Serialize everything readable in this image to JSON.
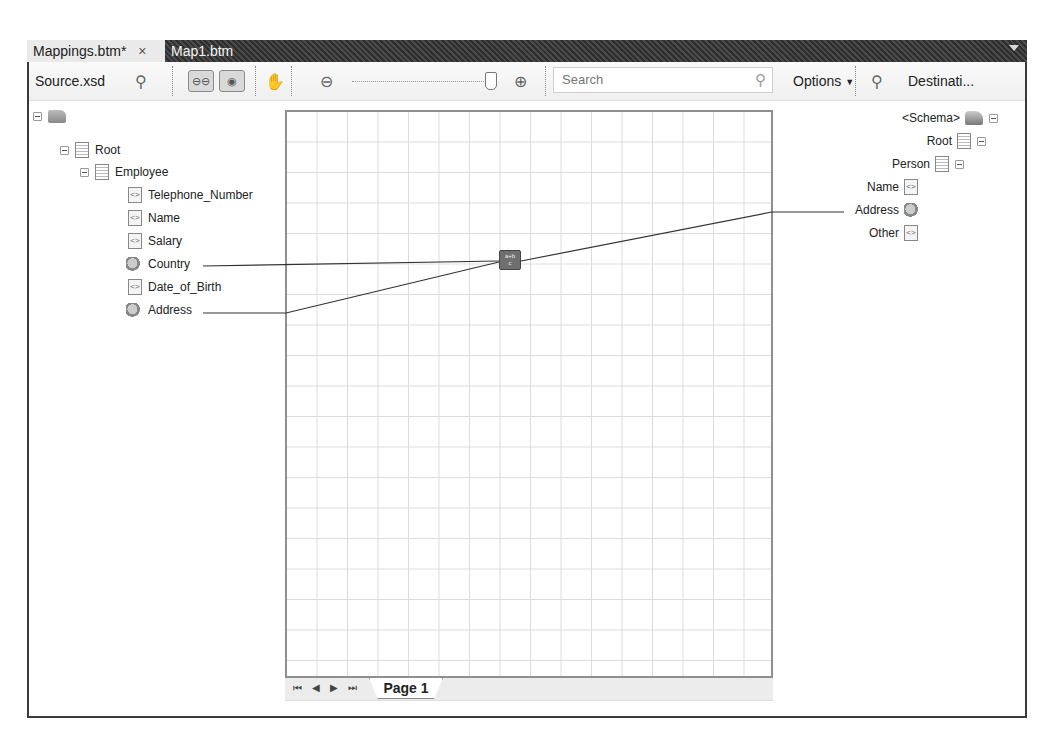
{
  "tabs": [
    {
      "label": "Mappings.btm*",
      "active": true,
      "close": "×"
    },
    {
      "label": "Map1.btm",
      "active": false
    }
  ],
  "toolbar": {
    "source_label": "Source.xsd",
    "search_placeholder": "Search",
    "options_label": "Options",
    "destination_label": "Destinati...",
    "zoom_level_percent": 100,
    "icons": [
      "source-schema-icon",
      "relevance-links-icon",
      "relevance-functoids-icon",
      "pan-hand-icon",
      "zoom-out-icon",
      "zoom-slider",
      "zoom-in-icon",
      "search-icon",
      "destination-schema-icon"
    ]
  },
  "source_tree": {
    "root_icon": "folder-icon",
    "nodes": [
      {
        "label": "Root",
        "type": "record",
        "level": 1
      },
      {
        "label": "Employee",
        "type": "record",
        "level": 2
      },
      {
        "label": "Telephone_Number",
        "type": "field",
        "level": 3
      },
      {
        "label": "Name",
        "type": "field",
        "level": 3
      },
      {
        "label": "Salary",
        "type": "field",
        "level": 3
      },
      {
        "label": "Country",
        "type": "linked-field",
        "level": 3
      },
      {
        "label": "Date_of_Birth",
        "type": "field",
        "level": 3
      },
      {
        "label": "Address",
        "type": "linked-field",
        "level": 3
      }
    ]
  },
  "destination_tree": {
    "nodes": [
      {
        "label": "<Schema>",
        "type": "schema"
      },
      {
        "label": "Root",
        "type": "record"
      },
      {
        "label": "Person",
        "type": "record"
      },
      {
        "label": "Name",
        "type": "field"
      },
      {
        "label": "Address",
        "type": "linked-field"
      },
      {
        "label": "Other",
        "type": "field"
      }
    ]
  },
  "canvas": {
    "functoid": {
      "name": "string-concatenate-functoid",
      "glyph_top": "a+b",
      "glyph_bottom": "c"
    },
    "links": [
      {
        "from": "Country",
        "to": "functoid"
      },
      {
        "from": "Address",
        "to": "functoid"
      },
      {
        "from": "functoid",
        "to": "Address"
      }
    ],
    "pager": {
      "first": "⏮",
      "prev": "◀",
      "next": "▶",
      "last": "⏭"
    },
    "page_tab": "Page 1"
  }
}
